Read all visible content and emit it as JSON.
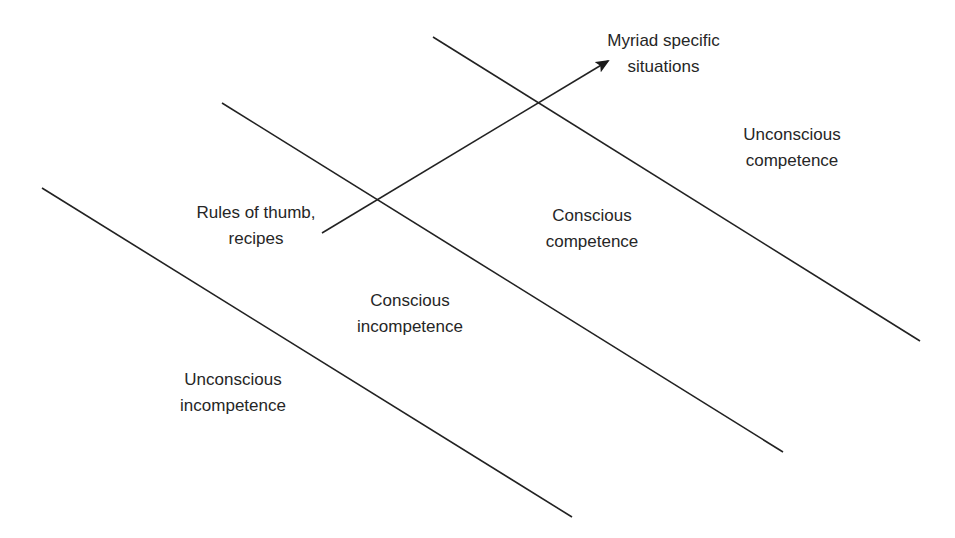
{
  "diagram": {
    "type": "competence-stages",
    "stroke_color": "#222222",
    "background": "#ffffff",
    "boundary_lines": [
      {
        "id": "boundary-1",
        "x1": 42,
        "y1": 188,
        "x2": 572,
        "y2": 517
      },
      {
        "id": "boundary-2",
        "x1": 222,
        "y1": 103,
        "x2": 783,
        "y2": 452
      },
      {
        "id": "boundary-3",
        "x1": 433,
        "y1": 37,
        "x2": 920,
        "y2": 341
      }
    ],
    "arrow": {
      "x1": 322,
      "y1": 233,
      "x2": 608,
      "y2": 61
    },
    "regions": [
      {
        "line1": "Unconscious",
        "line2": "incompetence"
      },
      {
        "line1": "Conscious",
        "line2": "incompetence"
      },
      {
        "line1": "Conscious",
        "line2": "competence"
      },
      {
        "line1": "Unconscious",
        "line2": "competence"
      }
    ],
    "arrow_start_label": {
      "line1": "Rules of thumb,",
      "line2": "recipes"
    },
    "arrow_end_label": {
      "line1": "Myriad specific",
      "line2": "situations"
    }
  }
}
